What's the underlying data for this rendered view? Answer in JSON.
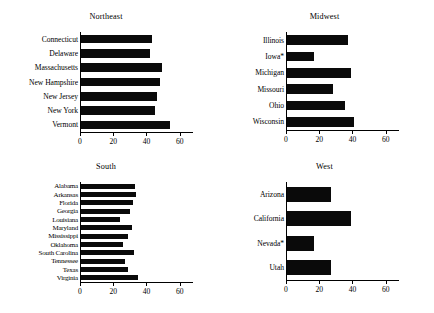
{
  "figure": {
    "clipped_header_text": "",
    "panel_count": 4
  },
  "chart_data": [
    {
      "type": "bar",
      "orientation": "horizontal",
      "title": "Northeast",
      "xlabel": "",
      "ylabel": "",
      "xlim": [
        0,
        68
      ],
      "xticks": [
        0,
        20,
        40,
        60
      ],
      "xticklabels": [
        "0",
        "20",
        "40",
        "60"
      ],
      "grid": false,
      "legend": null,
      "categories": [
        "Connecticut",
        "Delaware",
        "Massachusetts",
        "New Hampshire",
        "New Jersey",
        "New York",
        "Vermont"
      ],
      "values": [
        42.5,
        41.5,
        48.5,
        47.5,
        45.5,
        44.5,
        53.5
      ]
    },
    {
      "type": "bar",
      "orientation": "horizontal",
      "title": "Midwest",
      "xlabel": "",
      "ylabel": "",
      "xlim": [
        0,
        68
      ],
      "xticks": [
        0,
        20,
        40,
        60
      ],
      "xticklabels": [
        "0",
        "20",
        "40",
        "60"
      ],
      "grid": false,
      "legend": null,
      "categories": [
        "Illinois",
        "Iowa*",
        "Michigan",
        "Missouri",
        "Ohio",
        "Wisconsin"
      ],
      "values": [
        36.5,
        16.5,
        38.5,
        27.5,
        35.0,
        40.5
      ]
    },
    {
      "type": "bar",
      "orientation": "horizontal",
      "title": "South",
      "xlabel": "",
      "ylabel": "",
      "xlim": [
        0,
        68
      ],
      "xticks": [
        0,
        20,
        40,
        60
      ],
      "xticklabels": [
        "0",
        "20",
        "40",
        "60"
      ],
      "grid": false,
      "legend": null,
      "categories": [
        "Alabama",
        "Arkansas",
        "Florida",
        "Georgia",
        "Louisiana",
        "Maryland",
        "Mississippi",
        "Oklahoma",
        "South Carolina",
        "Tennessee",
        "Texas",
        "Virginia"
      ],
      "values": [
        32.5,
        33.0,
        31.0,
        29.5,
        23.5,
        30.5,
        28.5,
        25.0,
        32.0,
        26.5,
        28.0,
        34.0
      ]
    },
    {
      "type": "bar",
      "orientation": "horizontal",
      "title": "West",
      "xlabel": "",
      "ylabel": "",
      "xlim": [
        0,
        68
      ],
      "xticks": [
        0,
        20,
        40,
        60
      ],
      "xticklabels": [
        "0",
        "20",
        "40",
        "60"
      ],
      "grid": false,
      "legend": null,
      "categories": [
        "Arizona",
        "California",
        "Nevada*",
        "Utah"
      ],
      "values": [
        26.5,
        38.5,
        16.5,
        26.5
      ]
    }
  ],
  "colors": {
    "bar": "#0a0a0a",
    "axis": "#000000",
    "background": "#ffffff",
    "text": "#000000"
  }
}
